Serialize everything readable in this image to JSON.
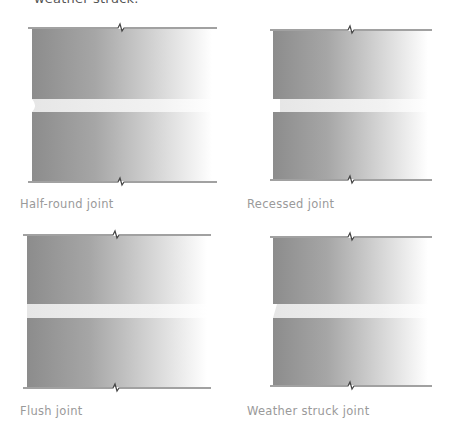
{
  "top_caption": "weather struck.",
  "colors": {
    "brick_dark": "#8a8a8a",
    "brick_light": "#ffffff",
    "mortar": "#ececec",
    "line": "#444444",
    "label": "#9a9a9a"
  },
  "panels": [
    {
      "id": "half-round",
      "label": "Half-round joint"
    },
    {
      "id": "recessed",
      "label": "Recessed joint"
    },
    {
      "id": "flush",
      "label": "Flush joint"
    },
    {
      "id": "weather-struck",
      "label": "Weather struck joint"
    }
  ]
}
